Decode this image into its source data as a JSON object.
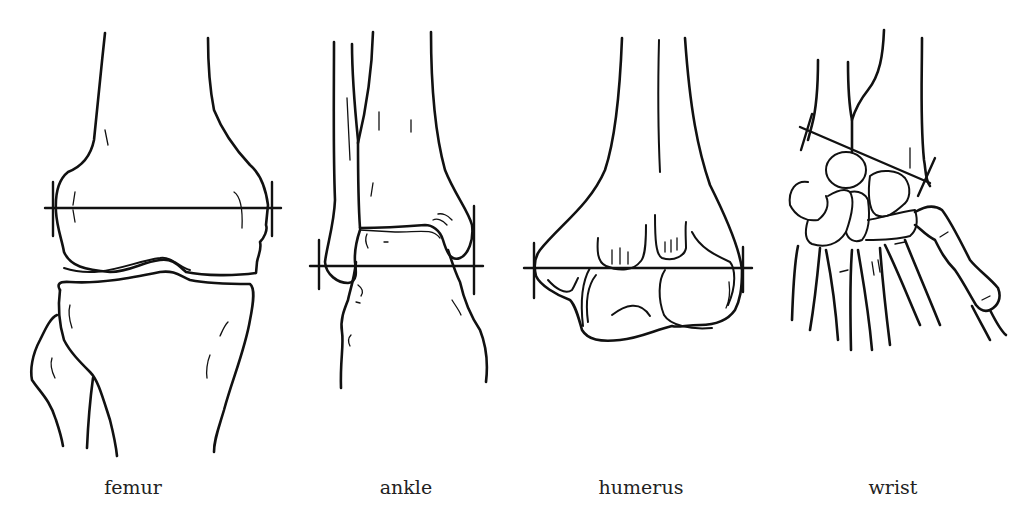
{
  "figure": {
    "panels": [
      {
        "id": "femur",
        "label": "femur",
        "label_x": 133
      },
      {
        "id": "ankle",
        "label": "ankle",
        "label_x": 406
      },
      {
        "id": "humerus",
        "label": "humerus",
        "label_x": 641
      },
      {
        "id": "wrist",
        "label": "wrist",
        "label_x": 893
      }
    ],
    "colors": {
      "line": "#111111",
      "background": "#ffffff",
      "text": "#222222"
    }
  }
}
